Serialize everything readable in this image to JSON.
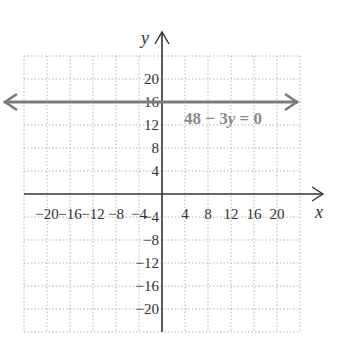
{
  "chart_data": {
    "type": "line",
    "title": "",
    "xlabel": "x",
    "ylabel": "y",
    "xlim": [
      -24,
      24
    ],
    "ylim": [
      -24,
      24
    ],
    "grid": true,
    "x_ticks": [
      -20,
      -16,
      -12,
      -8,
      -4,
      4,
      8,
      12,
      16,
      20
    ],
    "y_ticks": [
      20,
      16,
      12,
      8,
      4,
      -4,
      -8,
      -12,
      -16,
      -20
    ],
    "x_tick_labels": [
      "−20",
      "−16",
      "−12",
      "−8",
      "−4",
      "4",
      "8",
      "12",
      "16",
      "20"
    ],
    "y_tick_labels": [
      "20",
      "16",
      "12",
      "8",
      "4",
      "−4",
      "−8",
      "−12",
      "−16",
      "−20"
    ],
    "series": [
      {
        "name": "48 − 3y = 0",
        "equation": "48 - 3y = 0",
        "kind": "horizontal line with arrows",
        "y": 16,
        "x": [
          -24,
          24
        ],
        "color": "#7a7a7a"
      }
    ],
    "annotations": [
      {
        "text": "48 − 3y = 0",
        "x": 10,
        "y": 13
      }
    ]
  },
  "labels": {
    "x_axis": "x",
    "y_axis": "y",
    "equation_prefix": "48 − 3",
    "equation_var": "y",
    "equation_suffix": " = 0"
  },
  "colors": {
    "line": "#7a7a7a",
    "axis": "#333333",
    "grid": "#b5b5b5"
  }
}
